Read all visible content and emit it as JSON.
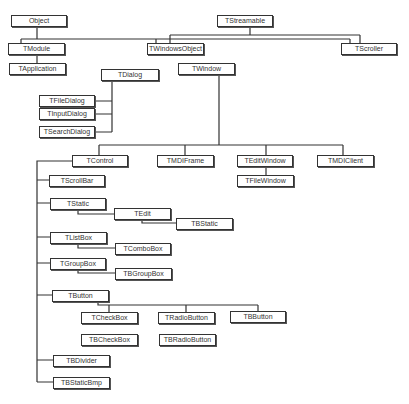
{
  "diagram": {
    "type": "class-hierarchy",
    "line_color": "#333333",
    "nodes": {
      "object": "Object",
      "tstreamable": "TStreamable",
      "tmodule": "TModule",
      "twindowsobject": "TWindowsObject",
      "tscroller": "TScroller",
      "tapplication": "TApplication",
      "tdialog": "TDialog",
      "twindow": "TWindow",
      "tfiledialog": "TFileDialog",
      "tinputdialog": "TInputDialog",
      "tsearchdialog": "TSearchDialog",
      "tcontrol": "TControl",
      "tmdiframe": "TMDIFrame",
      "teditwindow": "TEditWindow",
      "tmdiclient": "TMDIClient",
      "tfilewindow": "TFileWindow",
      "tscrollbar": "TScrollBar",
      "tstatic": "TStatic",
      "tedit": "TEdit",
      "tbstatic": "TBStatic",
      "tlistbox": "TListBox",
      "tcombobox": "TComboBox",
      "tgroupbox": "TGroupBox",
      "tbgroupbox": "TBGroupBox",
      "tbutton": "TButton",
      "tcheckbox": "TCheckBox",
      "tradiobutton": "TRadioButton",
      "tbbutton": "TBButton",
      "tbcheckbox": "TBCheckBox",
      "tbradiobutton": "TBRadioButton",
      "tbdivider": "TBDivider",
      "tbstaticbmp": "TBStaticBmp"
    },
    "edges": [
      [
        "Object",
        "TModule"
      ],
      [
        "Object",
        "TWindowsObject"
      ],
      [
        "Object",
        "TScroller"
      ],
      [
        "TStreamable",
        "TWindowsObject"
      ],
      [
        "TStreamable",
        "TScroller"
      ],
      [
        "TModule",
        "TApplication"
      ],
      [
        "TDialog",
        "TFileDialog"
      ],
      [
        "TDialog",
        "TInputDialog"
      ],
      [
        "TDialog",
        "TSearchDialog"
      ],
      [
        "TWindow",
        "TControl"
      ],
      [
        "TWindow",
        "TMDIFrame"
      ],
      [
        "TWindow",
        "TEditWindow"
      ],
      [
        "TWindow",
        "TMDIClient"
      ],
      [
        "TEditWindow",
        "TFileWindow"
      ],
      [
        "TControl",
        "TScrollBar"
      ],
      [
        "TControl",
        "TStatic"
      ],
      [
        "TControl",
        "TListBox"
      ],
      [
        "TControl",
        "TGroupBox"
      ],
      [
        "TControl",
        "TButton"
      ],
      [
        "TControl",
        "TBDivider"
      ],
      [
        "TControl",
        "TBStaticBmp"
      ],
      [
        "TStatic",
        "TEdit"
      ],
      [
        "TEdit",
        "TBStatic"
      ],
      [
        "TListBox",
        "TComboBox"
      ],
      [
        "TGroupBox",
        "TBGroupBox"
      ],
      [
        "TButton",
        "TCheckBox"
      ],
      [
        "TButton",
        "TRadioButton"
      ],
      [
        "TButton",
        "TBButton"
      ]
    ]
  }
}
